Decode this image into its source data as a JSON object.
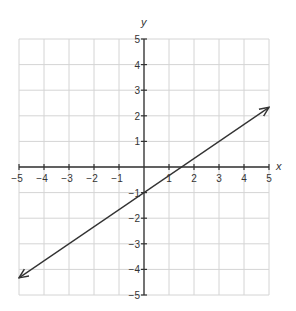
{
  "chart_data": {
    "type": "line",
    "title": "",
    "xlabel": "x",
    "ylabel": "y",
    "xlim": [
      -5,
      5
    ],
    "ylim": [
      -5,
      5
    ],
    "grid": true,
    "xticks": [
      -5,
      -4,
      -3,
      -2,
      -1,
      1,
      2,
      3,
      4,
      5
    ],
    "yticks": [
      -5,
      -4,
      -3,
      -2,
      -1,
      1,
      2,
      3,
      4,
      5
    ],
    "series": [
      {
        "name": "line",
        "equation": "y = (2/3)x - 1",
        "x": [
          -5,
          5
        ],
        "y": [
          -4.33,
          2.33
        ],
        "arrows": "both"
      }
    ],
    "colors": {
      "grid": "#d4d4d4",
      "axis": "#333333",
      "line": "#333333"
    }
  }
}
